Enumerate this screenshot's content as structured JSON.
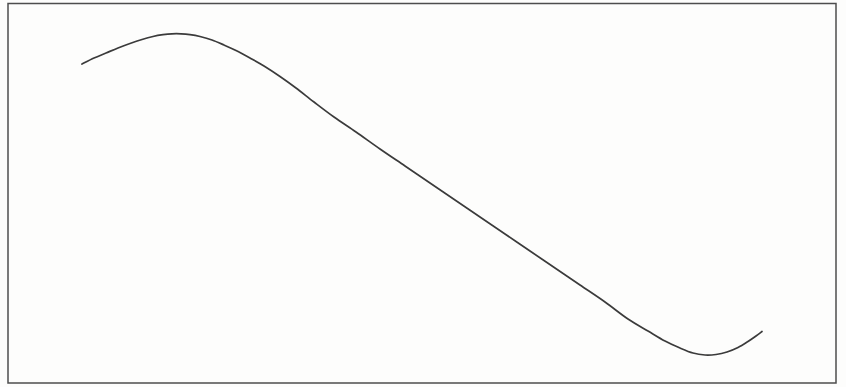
{
  "figure": {
    "background_color": "#fdfdfc",
    "frame_color": "#4d4d4d",
    "frame_stroke_width": 1.5,
    "line_color": "#3b3b3b",
    "line_stroke_width": 1.7
  },
  "chart_data": {
    "type": "line",
    "title": "",
    "xlabel": "",
    "ylabel": "",
    "axes_visible": false,
    "grid": false,
    "legend": false,
    "canvas_px": {
      "width": 846,
      "height": 387
    },
    "frame_px": {
      "x": 8,
      "y": 3.5,
      "width": 828,
      "height": 379.5
    },
    "series": [
      {
        "name": "waveform",
        "points_px": [
          [
            82,
            64
          ],
          [
            94,
            58
          ],
          [
            106,
            53
          ],
          [
            118,
            48
          ],
          [
            130,
            43.5
          ],
          [
            142,
            39.5
          ],
          [
            153,
            36.5
          ],
          [
            163,
            34.7
          ],
          [
            172,
            33.8
          ],
          [
            181,
            33.8
          ],
          [
            190,
            34.6
          ],
          [
            200,
            36.5
          ],
          [
            212,
            40
          ],
          [
            224,
            45
          ],
          [
            236,
            50.5
          ],
          [
            250,
            58
          ],
          [
            264,
            66
          ],
          [
            280,
            76.5
          ],
          [
            296,
            88
          ],
          [
            314,
            102
          ],
          [
            334,
            117
          ],
          [
            356,
            132
          ],
          [
            380,
            149
          ],
          [
            405,
            166
          ],
          [
            430,
            183
          ],
          [
            455,
            200
          ],
          [
            480,
            217
          ],
          [
            505,
            234
          ],
          [
            530,
            251
          ],
          [
            555,
            268
          ],
          [
            580,
            285
          ],
          [
            605,
            302
          ],
          [
            628,
            319
          ],
          [
            648,
            331
          ],
          [
            665,
            341
          ],
          [
            680,
            348
          ],
          [
            693,
            353
          ],
          [
            705,
            355
          ],
          [
            716,
            354.5
          ],
          [
            727,
            352
          ],
          [
            738,
            347.5
          ],
          [
            748,
            341.5
          ],
          [
            756,
            336
          ],
          [
            762,
            331.5
          ]
        ]
      }
    ],
    "shape_summary": {
      "start_px": [
        82,
        64
      ],
      "crest_px": [
        172,
        34
      ],
      "trough_px": [
        705,
        355
      ],
      "end_px": [
        762,
        331.5
      ]
    }
  }
}
